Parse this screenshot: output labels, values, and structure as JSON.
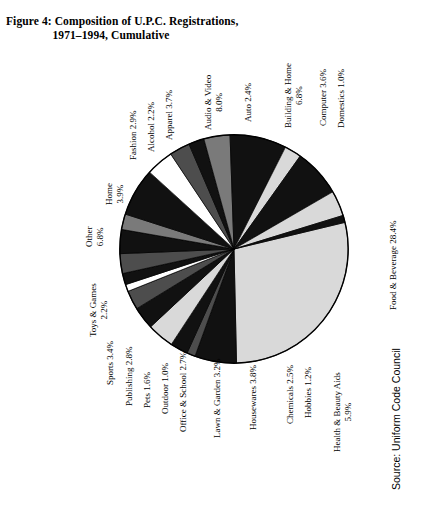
{
  "figure": {
    "title_lines": [
      "Figure 4: Composition of U.P.C. Registrations,",
      "1971–1994, Cumulative"
    ],
    "source": "Source: Uniform Code Council"
  },
  "chart_data": {
    "type": "pie",
    "xlabel": "",
    "ylabel": "",
    "units": "percent",
    "legend": "none (direct labels)",
    "grid": false,
    "total": 100.0,
    "categories": [
      "Food & Beverage",
      "Health & Beauty Aids",
      "Hobbies",
      "Chemicals",
      "Housewares",
      "Lawn & Garden",
      "Office & School",
      "Outdoor",
      "Pets",
      "Publishing",
      "Sports",
      "Toys & Games",
      "Other",
      "Home",
      "Fashion",
      "Alcohol",
      "Apparel",
      "Audio & Video",
      "Auto",
      "Building & Home",
      "Computer",
      "Domestics"
    ],
    "values": [
      28.4,
      5.9,
      1.2,
      2.5,
      3.8,
      3.2,
      2.7,
      1.0,
      1.6,
      2.8,
      3.4,
      2.2,
      6.8,
      3.9,
      2.9,
      2.2,
      3.7,
      8.0,
      2.4,
      6.8,
      3.6,
      1.0
    ],
    "slice_fills": [
      "#d9d9d9",
      "#111111",
      "#4d4d4d",
      "#111111",
      "#d9d9d9",
      "#111111",
      "#4d4d4d",
      "#ffffff",
      "#111111",
      "#4d4d4d",
      "#111111",
      "#7a7a7a",
      "#111111",
      "#ffffff",
      "#4d4d4d",
      "#111111",
      "#7a7a7a",
      "#111111",
      "#d9d9d9",
      "#111111",
      "#d9d9d9",
      "#111111"
    ],
    "slices": [
      {
        "label": "Food & Beverage",
        "value": 28.4,
        "text": "Food & Beverage 28.4%",
        "fill": "#d9d9d9"
      },
      {
        "label": "Health & Beauty Aids",
        "value": 5.9,
        "text": "Health & Beauty Aids 5.9%",
        "fill": "#111111"
      },
      {
        "label": "Hobbies",
        "value": 1.2,
        "text": "Hobbies 1.2%",
        "fill": "#4d4d4d"
      },
      {
        "label": "Chemicals",
        "value": 2.5,
        "text": "Chemicals 2.5%",
        "fill": "#111111"
      },
      {
        "label": "Housewares",
        "value": 3.8,
        "text": "Housewares  3.8%",
        "fill": "#d9d9d9"
      },
      {
        "label": "Lawn & Garden",
        "value": 3.2,
        "text": "Lawn & Garden 3.2%",
        "fill": "#111111"
      },
      {
        "label": "Office & School",
        "value": 2.7,
        "text": "Office & School 2.7%",
        "fill": "#4d4d4d"
      },
      {
        "label": "Outdoor",
        "value": 1.0,
        "text": "Outdoor 1.0%",
        "fill": "#ffffff"
      },
      {
        "label": "Pets",
        "value": 1.6,
        "text": "Pets 1.6%",
        "fill": "#111111"
      },
      {
        "label": "Publishing",
        "value": 2.8,
        "text": "Publishing 2.8%",
        "fill": "#4d4d4d"
      },
      {
        "label": "Sports",
        "value": 3.4,
        "text": "Sports 3.4%",
        "fill": "#111111"
      },
      {
        "label": "Toys & Games",
        "value": 2.2,
        "text": "Toys & Games 2.2%",
        "fill": "#7a7a7a"
      },
      {
        "label": "Other",
        "value": 6.8,
        "text": "Other 6.8%",
        "fill": "#111111"
      },
      {
        "label": "Home",
        "value": 3.9,
        "text": "Home 3.9%",
        "fill": "#ffffff"
      },
      {
        "label": "Fashion",
        "value": 2.9,
        "text": "Fashion 2.9%",
        "fill": "#4d4d4d"
      },
      {
        "label": "Alcohol",
        "value": 2.2,
        "text": "Alcohol 2.2%",
        "fill": "#111111"
      },
      {
        "label": "Apparel",
        "value": 3.7,
        "text": "Apparel 3.7%",
        "fill": "#7a7a7a"
      },
      {
        "label": "Audio & Video",
        "value": 8.0,
        "text": "Audio & Video 8.0%",
        "fill": "#111111"
      },
      {
        "label": "Auto",
        "value": 2.4,
        "text": "Auto 2.4%",
        "fill": "#d9d9d9"
      },
      {
        "label": "Building & Home",
        "value": 6.8,
        "text": "Building & Home 6.8%",
        "fill": "#111111"
      },
      {
        "label": "Computer",
        "value": 3.6,
        "text": "Computer 3.6%",
        "fill": "#d9d9d9"
      },
      {
        "label": "Domestics",
        "value": 1.0,
        "text": "Domestics 1.0%",
        "fill": "#111111"
      }
    ]
  },
  "labels": [
    {
      "name": "food-and-beverage",
      "lines": [
        "Food & Beverage 28.4%"
      ],
      "x": 388,
      "y": 310,
      "align": "left"
    },
    {
      "name": "domestics",
      "lines": [
        "Domestics 1.0%"
      ],
      "x": 336,
      "y": 128,
      "align": "left"
    },
    {
      "name": "computer",
      "lines": [
        "Computer 3.6%"
      ],
      "x": 318,
      "y": 126,
      "align": "left"
    },
    {
      "name": "building-and-home",
      "lines": [
        "Building & Home",
        "6.8%"
      ],
      "x": 283,
      "y": 128,
      "align": "center"
    },
    {
      "name": "auto",
      "lines": [
        "Auto 2.4%"
      ],
      "x": 243,
      "y": 122,
      "align": "left"
    },
    {
      "name": "audio-and-video",
      "lines": [
        "Audio & Video",
        "8.0%"
      ],
      "x": 203,
      "y": 130,
      "align": "center"
    },
    {
      "name": "apparel",
      "lines": [
        "Apparel 3.7%"
      ],
      "x": 164,
      "y": 140,
      "align": "left"
    },
    {
      "name": "alcohol",
      "lines": [
        "Alcohol 2.2%"
      ],
      "x": 146,
      "y": 152,
      "align": "left"
    },
    {
      "name": "fashion",
      "lines": [
        "Fashion 2.9%"
      ],
      "x": 128,
      "y": 160,
      "align": "left"
    },
    {
      "name": "home",
      "lines": [
        "Home",
        "3.9%"
      ],
      "x": 104,
      "y": 205,
      "align": "center"
    },
    {
      "name": "other",
      "lines": [
        "Other",
        "6.8%"
      ],
      "x": 84,
      "y": 247,
      "align": "center"
    },
    {
      "name": "toys-and-games",
      "lines": [
        "Toys & Games",
        "2.2%"
      ],
      "x": 88,
      "y": 337,
      "align": "center"
    },
    {
      "name": "sports",
      "lines": [
        "Sports 3.4%"
      ],
      "x": 105,
      "y": 385,
      "align": "left"
    },
    {
      "name": "publishing",
      "lines": [
        "Publishing 2.8%"
      ],
      "x": 124,
      "y": 406,
      "align": "left"
    },
    {
      "name": "pets",
      "lines": [
        "Pets 1.6%"
      ],
      "x": 142,
      "y": 408,
      "align": "left"
    },
    {
      "name": "outdoor",
      "lines": [
        "Outdoor 1.0%"
      ],
      "x": 160,
      "y": 414,
      "align": "left"
    },
    {
      "name": "office-and-school",
      "lines": [
        "Office & School 2.7%"
      ],
      "x": 178,
      "y": 432,
      "align": "left"
    },
    {
      "name": "lawn-and-garden",
      "lines": [
        "Lawn & Garden 3.2%"
      ],
      "x": 212,
      "y": 438,
      "align": "left"
    },
    {
      "name": "housewares",
      "lines": [
        "Housewares  3.8%"
      ],
      "x": 248,
      "y": 430,
      "align": "left"
    },
    {
      "name": "chemicals",
      "lines": [
        "Chemicals 2.5%"
      ],
      "x": 285,
      "y": 424,
      "align": "left"
    },
    {
      "name": "hobbies",
      "lines": [
        "Hobbies 1.2%"
      ],
      "x": 303,
      "y": 418,
      "align": "left"
    },
    {
      "name": "health-and-beauty-aids",
      "lines": [
        "Health & Beauty Aids",
        "5.9%"
      ],
      "x": 332,
      "y": 452,
      "align": "center"
    }
  ],
  "source_position": {
    "x": 390,
    "y": 490
  }
}
